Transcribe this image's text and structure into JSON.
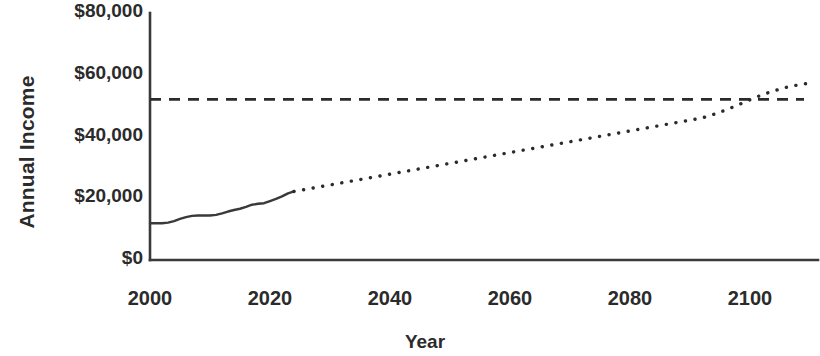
{
  "chart_data": {
    "type": "line",
    "title": "",
    "xlabel": "Year",
    "ylabel": "Annual Income",
    "xlim": [
      2000,
      2110
    ],
    "ylim": [
      0,
      80000
    ],
    "grid": false,
    "legend": "none",
    "x_ticks": [
      "2000",
      "2020",
      "2040",
      "2060",
      "2080",
      "2100"
    ],
    "x_tick_values": [
      2000,
      2020,
      2040,
      2060,
      2080,
      2100
    ],
    "y_ticks": [
      "$0",
      "$20,000",
      "$40,000",
      "$60,000",
      "$80,000"
    ],
    "y_tick_values": [
      0,
      20000,
      40000,
      60000,
      80000
    ],
    "series": [
      {
        "name": "Historical annual income",
        "style": "solid",
        "color": "#3a3a3a",
        "x": [
          2000,
          2001,
          2002,
          2003,
          2004,
          2005,
          2006,
          2007,
          2008,
          2009,
          2010,
          2011,
          2012,
          2013,
          2014,
          2015,
          2016,
          2017,
          2018,
          2019,
          2020,
          2021,
          2022,
          2023,
          2024
        ],
        "values": [
          11900,
          11900,
          11900,
          12100,
          12600,
          13300,
          13900,
          14300,
          14400,
          14400,
          14400,
          14600,
          15100,
          15700,
          16200,
          16600,
          17200,
          17900,
          18200,
          18400,
          19100,
          19800,
          20600,
          21600,
          22200
        ]
      },
      {
        "name": "Projected annual income",
        "style": "dotted",
        "color": "#2b2b2b",
        "x": [
          2024,
          2026,
          2028,
          2030,
          2032,
          2034,
          2036,
          2038,
          2040,
          2042,
          2044,
          2046,
          2048,
          2050,
          2052,
          2054,
          2056,
          2058,
          2060,
          2062,
          2064,
          2066,
          2068,
          2070,
          2072,
          2074,
          2076,
          2078,
          2080,
          2082,
          2084,
          2086,
          2088,
          2090,
          2092,
          2094,
          2096,
          2098,
          2100,
          2102,
          2104,
          2106,
          2108,
          2110
        ],
        "values": [
          22200,
          22900,
          23600,
          24300,
          25000,
          25700,
          26400,
          27100,
          27800,
          28500,
          29200,
          29900,
          30600,
          31300,
          32000,
          32700,
          33400,
          34100,
          34800,
          35500,
          36200,
          36900,
          37600,
          38300,
          39000,
          39700,
          40400,
          41100,
          41800,
          42500,
          43200,
          43900,
          44600,
          45300,
          46000,
          47200,
          48600,
          50200,
          51900,
          53500,
          54800,
          55900,
          56700,
          57300
        ]
      },
      {
        "name": "Reference income threshold",
        "style": "dashed",
        "color": "#2b2b2b",
        "constant_value": 52000,
        "x_range": [
          2000,
          2109
        ]
      }
    ]
  }
}
